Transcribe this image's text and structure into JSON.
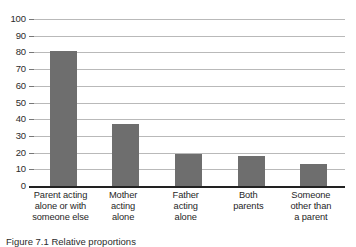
{
  "chart_data": {
    "type": "bar",
    "title": "",
    "subtitle": "",
    "xlabel": "",
    "ylabel": "",
    "ylim": [
      0,
      100
    ],
    "yticks": [
      0,
      10,
      20,
      30,
      40,
      50,
      60,
      70,
      80,
      90,
      100
    ],
    "grid": true,
    "legend": null,
    "bar_color": "#6e6e6e",
    "gridline_color": "#b9b9b9",
    "axis_color": "#222222",
    "categories": [
      "Parent acting alone or with someone else",
      "Mother acting alone",
      "Father acting alone",
      "Both parents",
      "Someone other than a parent"
    ],
    "category_lines": [
      [
        "Parent acting",
        "alone or with",
        "someone else"
      ],
      [
        "Mother",
        "acting",
        "alone"
      ],
      [
        "Father",
        "acting",
        "alone"
      ],
      [
        "Both",
        "parents"
      ],
      [
        "Someone",
        "other than",
        "a parent"
      ]
    ],
    "values": [
      81,
      37,
      19,
      18,
      13
    ]
  },
  "caption": {
    "text": "Figure 7.1  Relative proportions"
  }
}
